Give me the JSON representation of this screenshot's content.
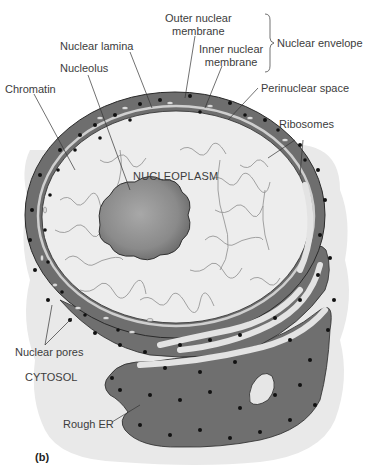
{
  "figure": {
    "panel_label": "(b)",
    "colors": {
      "cytosol": "#e8e8e8",
      "envelope": "#6e6e6e",
      "nucleoplasm": "#ededed",
      "nucleolus": "#8a8a8a",
      "ribosome": "#111111",
      "label_text": "#3c3c3c",
      "leader_line": "#333333"
    }
  },
  "labels": {
    "outer_nuclear_membrane": [
      "Outer nuclear",
      "membrane"
    ],
    "inner_nuclear_membrane": [
      "Inner nuclear",
      "membrane"
    ],
    "nuclear_envelope": "Nuclear envelope",
    "nuclear_lamina": "Nuclear lamina",
    "nucleolus": "Nucleolus",
    "chromatin": "Chromatin",
    "perinuclear_space": "Perinuclear space",
    "ribosomes": "Ribosomes",
    "nucleoplasm": "NUCLEOPLASM",
    "nuclear_pores": "Nuclear pores",
    "cytosol": "CYTOSOL",
    "rough_er": "Rough ER"
  }
}
